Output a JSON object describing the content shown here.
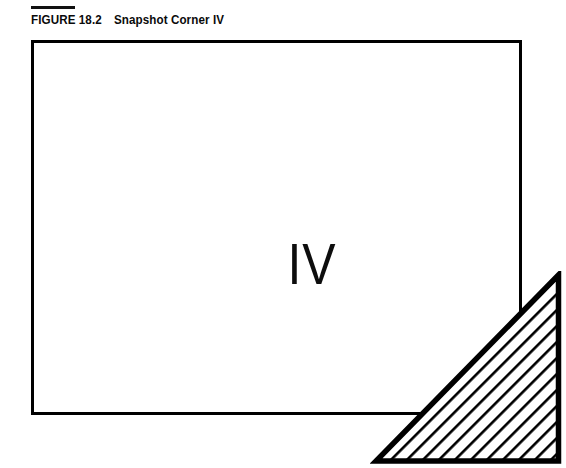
{
  "figure": {
    "caption_label": "FIGURE 18.2",
    "caption_title": "Snapshot Corner IV",
    "caption_full": "FIGURE 18.2   Snapshot Corner IV",
    "quadrant_label": "IV",
    "colors": {
      "ink": "#000000",
      "background": "#ffffff",
      "caption_ink": "#0a0a0a"
    }
  },
  "diagram": {
    "type": "corner-shading-diagram",
    "frame": {
      "name": "outer-rectangle",
      "x": 31,
      "y": 40,
      "width": 491,
      "height": 375,
      "stroke_width": 3,
      "fill": "none"
    },
    "label": {
      "text": "IV",
      "x": 272,
      "y": 222,
      "font_size": 58
    },
    "shaded_region": {
      "name": "bottom-right-triangle",
      "shape": "right-triangle",
      "right_angle_corner": "bottom-right",
      "vertices": [
        {
          "label": "apex-top",
          "x": 523,
          "y": 234
        },
        {
          "label": "base-left",
          "x": 345,
          "y": 420
        },
        {
          "label": "corner-bottom-right",
          "x": 523,
          "y": 420
        }
      ],
      "width": 178,
      "height": 186,
      "hatch": {
        "angle_deg": 45,
        "direction": "forward-slash",
        "line_width": 2,
        "spacing": 8,
        "color": "#000000"
      }
    }
  }
}
